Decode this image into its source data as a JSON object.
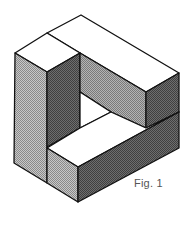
{
  "figure": {
    "caption": "Fig. 1",
    "colors": {
      "outline": "#111111",
      "top": "#ffffff",
      "light_face": "#b0b0b0",
      "medium_face": "#9a9a9a",
      "dark_face": "#5a5a5a"
    }
  }
}
